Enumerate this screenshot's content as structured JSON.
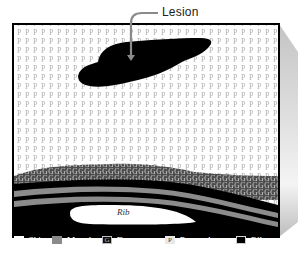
{
  "diagram": {
    "callout": {
      "label": "Lesion",
      "arrow_color": "#8a8a8a"
    },
    "rib_label": "Rib",
    "tissue_letters": {
      "parenchyma": "P",
      "fat": "G"
    },
    "colors": {
      "frame": "#000000",
      "parenchyma_bg": "#ffffff",
      "parenchyma_glyph": "#b5b5b5",
      "lesion": "#000000",
      "fat_bg": "#4a4a4a",
      "fat_glyph": "#cfcfcf",
      "muscle": "#8c8c8c",
      "skin": "#ffffff",
      "rib_cage": "#000000",
      "extrusion": "#d2d2d2"
    }
  },
  "legend": {
    "items": [
      {
        "key": "skin",
        "label": "Skin",
        "glyph": ""
      },
      {
        "key": "muscle",
        "label": "Muscle",
        "glyph": ""
      },
      {
        "key": "fat",
        "label": "Fat",
        "glyph": "G"
      },
      {
        "key": "parenchyma",
        "label": "Parenchyma",
        "glyph": "P"
      },
      {
        "key": "rib-cage",
        "label": "Rib cage",
        "glyph": ""
      }
    ]
  }
}
